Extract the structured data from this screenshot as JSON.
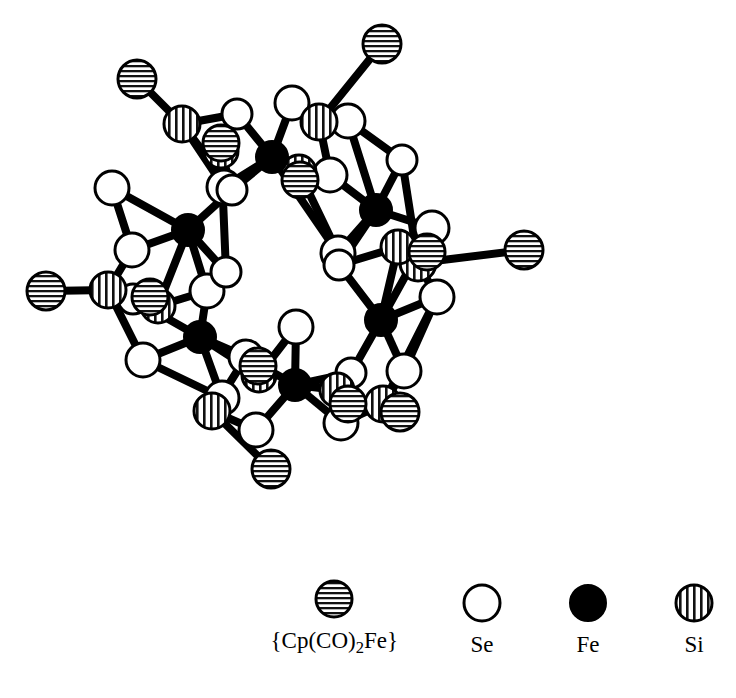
{
  "figure": {
    "background_color": "#ffffff",
    "line_color": "#000000"
  },
  "legend": {
    "items": [
      {
        "symbol": "horizontal-striped-circle",
        "label_html": "{Cp(CO)<sub>2</sub>Fe}",
        "label_text": "{Cp(CO)2Fe}",
        "fill": "horizontal-hatch",
        "name": "cp-co-2-fe"
      },
      {
        "symbol": "open-circle",
        "label_html": "Se",
        "label_text": "Se",
        "fill": "white",
        "name": "se"
      },
      {
        "symbol": "filled-circle",
        "label_html": "Fe",
        "label_text": "Fe",
        "fill": "black",
        "name": "fe"
      },
      {
        "symbol": "vertical-striped-circle",
        "label_html": "Si",
        "label_text": "Si",
        "fill": "vertical-hatch",
        "name": "si"
      }
    ]
  },
  "structure": {
    "symmetry": "6-fold (hexameric ring)",
    "center": {
      "x": 285,
      "y": 272
    },
    "atom_counts": {
      "Fe": 6,
      "Se": 24,
      "Si": 12,
      "CpCO2Fe": 6
    },
    "atoms": [
      {
        "id": "Fe1",
        "element": "Fe",
        "x": 272,
        "y": 157,
        "r": 16
      },
      {
        "id": "Fe2",
        "element": "Fe",
        "x": 376,
        "y": 210,
        "r": 16
      },
      {
        "id": "Fe3",
        "element": "Fe",
        "x": 381,
        "y": 320,
        "r": 16
      },
      {
        "id": "Fe4",
        "element": "Fe",
        "x": 295,
        "y": 385,
        "r": 16
      },
      {
        "id": "Fe5",
        "element": "Fe",
        "x": 200,
        "y": 337,
        "r": 16
      },
      {
        "id": "Fe6",
        "element": "Fe",
        "x": 188,
        "y": 230,
        "r": 16
      },
      {
        "id": "Se1a",
        "element": "Se",
        "x": 292,
        "y": 103,
        "r": 17
      },
      {
        "id": "Se1b",
        "element": "Se",
        "x": 224,
        "y": 187,
        "r": 17
      },
      {
        "id": "Se1c",
        "element": "Se",
        "x": 237,
        "y": 114,
        "r": 15
      },
      {
        "id": "Se1d",
        "element": "Se",
        "x": 330,
        "y": 175,
        "r": 17
      },
      {
        "id": "Se2a",
        "element": "Se",
        "x": 348,
        "y": 121,
        "r": 17
      },
      {
        "id": "Se2b",
        "element": "Se",
        "x": 338,
        "y": 253,
        "r": 17
      },
      {
        "id": "Se2c",
        "element": "Se",
        "x": 402,
        "y": 160,
        "r": 15
      },
      {
        "id": "Se2d",
        "element": "Se",
        "x": 432,
        "y": 228,
        "r": 17
      },
      {
        "id": "Se3a",
        "element": "Se",
        "x": 437,
        "y": 297,
        "r": 17
      },
      {
        "id": "Se3b",
        "element": "Se",
        "x": 351,
        "y": 373,
        "r": 15
      },
      {
        "id": "Se3c",
        "element": "Se",
        "x": 404,
        "y": 371,
        "r": 17
      },
      {
        "id": "Se3d",
        "element": "Se",
        "x": 339,
        "y": 265,
        "r": 15
      },
      {
        "id": "Se4a",
        "element": "Se",
        "x": 256,
        "y": 430,
        "r": 17
      },
      {
        "id": "Se4b",
        "element": "Se",
        "x": 341,
        "y": 423,
        "r": 17
      },
      {
        "id": "Se4c",
        "element": "Se",
        "x": 246,
        "y": 357,
        "r": 17
      },
      {
        "id": "Se4d",
        "element": "Se",
        "x": 296,
        "y": 327,
        "r": 17
      },
      {
        "id": "Se5a",
        "element": "Se",
        "x": 143,
        "y": 360,
        "r": 17
      },
      {
        "id": "Se5b",
        "element": "Se",
        "x": 222,
        "y": 398,
        "r": 17
      },
      {
        "id": "Se5c",
        "element": "Se",
        "x": 133,
        "y": 299,
        "r": 15
      },
      {
        "id": "Se5d",
        "element": "Se",
        "x": 207,
        "y": 291,
        "r": 17
      },
      {
        "id": "Se6a",
        "element": "Se",
        "x": 132,
        "y": 250,
        "r": 17
      },
      {
        "id": "Se6b",
        "element": "Se",
        "x": 226,
        "y": 272,
        "r": 15
      },
      {
        "id": "Se6c",
        "element": "Se",
        "x": 112,
        "y": 188,
        "r": 17
      },
      {
        "id": "Se6d",
        "element": "Se",
        "x": 232,
        "y": 190,
        "r": 15
      },
      {
        "id": "Si1a",
        "element": "Si",
        "x": 182,
        "y": 124,
        "r": 18
      },
      {
        "id": "Si1b",
        "element": "Si",
        "x": 221,
        "y": 151,
        "r": 17
      },
      {
        "id": "Si2a",
        "element": "Si",
        "x": 319,
        "y": 122,
        "r": 18
      },
      {
        "id": "Si2b",
        "element": "Si",
        "x": 299,
        "y": 172,
        "r": 17
      },
      {
        "id": "Si3a",
        "element": "Si",
        "x": 418,
        "y": 263,
        "r": 18
      },
      {
        "id": "Si3b",
        "element": "Si",
        "x": 398,
        "y": 247,
        "r": 17
      },
      {
        "id": "Si4a",
        "element": "Si",
        "x": 383,
        "y": 404,
        "r": 18
      },
      {
        "id": "Si4b",
        "element": "Si",
        "x": 337,
        "y": 390,
        "r": 17
      },
      {
        "id": "Si5a",
        "element": "Si",
        "x": 212,
        "y": 411,
        "r": 18
      },
      {
        "id": "Si5b",
        "element": "Si",
        "x": 259,
        "y": 375,
        "r": 17
      },
      {
        "id": "Si6a",
        "element": "Si",
        "x": 108,
        "y": 290,
        "r": 18
      },
      {
        "id": "Si6b",
        "element": "Si",
        "x": 158,
        "y": 306,
        "r": 17
      },
      {
        "id": "Cp1",
        "element": "CpCO2Fe",
        "x": 137,
        "y": 79,
        "r": 19
      },
      {
        "id": "Cp1b",
        "element": "CpCO2Fe",
        "x": 221,
        "y": 143,
        "r": 18
      },
      {
        "id": "Cp2",
        "element": "CpCO2Fe",
        "x": 382,
        "y": 44,
        "r": 19
      },
      {
        "id": "Cp2b",
        "element": "CpCO2Fe",
        "x": 300,
        "y": 180,
        "r": 18
      },
      {
        "id": "Cp3",
        "element": "CpCO2Fe",
        "x": 524,
        "y": 250,
        "r": 19
      },
      {
        "id": "Cp3b",
        "element": "CpCO2Fe",
        "x": 427,
        "y": 252,
        "r": 18
      },
      {
        "id": "Cp4",
        "element": "CpCO2Fe",
        "x": 400,
        "y": 412,
        "r": 19
      },
      {
        "id": "Cp4b",
        "element": "CpCO2Fe",
        "x": 348,
        "y": 404,
        "r": 18
      },
      {
        "id": "Cp5",
        "element": "CpCO2Fe",
        "x": 271,
        "y": 469,
        "r": 19
      },
      {
        "id": "Cp5b",
        "element": "CpCO2Fe",
        "x": 258,
        "y": 366,
        "r": 18
      },
      {
        "id": "Cp6",
        "element": "CpCO2Fe",
        "x": 46,
        "y": 291,
        "r": 19
      },
      {
        "id": "Cp6b",
        "element": "CpCO2Fe",
        "x": 150,
        "y": 297,
        "r": 18
      }
    ],
    "bonds": [
      [
        "Fe1",
        "Se1a"
      ],
      [
        "Fe1",
        "Se1b"
      ],
      [
        "Fe1",
        "Se1d"
      ],
      [
        "Fe1",
        "Se2b"
      ],
      [
        "Fe1",
        "Se6d"
      ],
      [
        "Fe1",
        "Si2b"
      ],
      [
        "Fe2",
        "Se2a"
      ],
      [
        "Fe2",
        "Se2c"
      ],
      [
        "Fe2",
        "Se2d"
      ],
      [
        "Fe2",
        "Se1d"
      ],
      [
        "Fe2",
        "Se2b"
      ],
      [
        "Fe2",
        "Se3d"
      ],
      [
        "Fe3",
        "Se3a"
      ],
      [
        "Fe3",
        "Se3c"
      ],
      [
        "Fe3",
        "Se2d"
      ],
      [
        "Fe3",
        "Se3b"
      ],
      [
        "Fe3",
        "Se3d"
      ],
      [
        "Fe3",
        "Si3b"
      ],
      [
        "Fe4",
        "Se4a"
      ],
      [
        "Fe4",
        "Se4b"
      ],
      [
        "Fe4",
        "Se4c"
      ],
      [
        "Fe4",
        "Se4d"
      ],
      [
        "Fe4",
        "Se3b"
      ],
      [
        "Fe4",
        "Si4b"
      ],
      [
        "Fe5",
        "Se5a"
      ],
      [
        "Fe5",
        "Se5b"
      ],
      [
        "Fe5",
        "Se5c"
      ],
      [
        "Fe5",
        "Se5d"
      ],
      [
        "Fe5",
        "Se4c"
      ],
      [
        "Fe5",
        "Si5b"
      ],
      [
        "Fe6",
        "Se6a"
      ],
      [
        "Fe6",
        "Se6b"
      ],
      [
        "Fe6",
        "Se6c"
      ],
      [
        "Fe6",
        "Se6d"
      ],
      [
        "Fe6",
        "Se5d"
      ],
      [
        "Fe6",
        "Si6b"
      ],
      [
        "Si1a",
        "Se1c"
      ],
      [
        "Si1a",
        "Se1b"
      ],
      [
        "Si1a",
        "Se6d"
      ],
      [
        "Si1a",
        "Cp1"
      ],
      [
        "Si1b",
        "Se1c"
      ],
      [
        "Si1b",
        "Se6d"
      ],
      [
        "Si1b",
        "Se6b"
      ],
      [
        "Se1c",
        "Fe1"
      ],
      [
        "Se1a",
        "Si2a"
      ],
      [
        "Si2a",
        "Se1a"
      ],
      [
        "Si2a",
        "Se2a"
      ],
      [
        "Si2a",
        "Se1d"
      ],
      [
        "Si2a",
        "Cp2"
      ],
      [
        "Si2b",
        "Se1d"
      ],
      [
        "Si2b",
        "Se2b"
      ],
      [
        "Si3a",
        "Se2d"
      ],
      [
        "Si3a",
        "Se3a"
      ],
      [
        "Si3a",
        "Se2c"
      ],
      [
        "Si3a",
        "Cp3"
      ],
      [
        "Si3b",
        "Se2d"
      ],
      [
        "Si3b",
        "Se3d"
      ],
      [
        "Si4a",
        "Se3c"
      ],
      [
        "Si4a",
        "Se4b"
      ],
      [
        "Si4a",
        "Se3a"
      ],
      [
        "Si4a",
        "Cp4"
      ],
      [
        "Si4b",
        "Se3b"
      ],
      [
        "Si4b",
        "Se4b"
      ],
      [
        "Si5a",
        "Se4a"
      ],
      [
        "Si5a",
        "Se5b"
      ],
      [
        "Si5a",
        "Se4c"
      ],
      [
        "Si5a",
        "Cp5"
      ],
      [
        "Si5b",
        "Se4c"
      ],
      [
        "Si5b",
        "Se4d"
      ],
      [
        "Si6a",
        "Se5c"
      ],
      [
        "Si6a",
        "Se6a"
      ],
      [
        "Si6a",
        "Se5a"
      ],
      [
        "Si6a",
        "Cp6"
      ],
      [
        "Si6b",
        "Se5d"
      ],
      [
        "Si6b",
        "Se5c"
      ],
      [
        "Se2c",
        "Se2a"
      ],
      [
        "Se3c",
        "Se3a"
      ],
      [
        "Se5b",
        "Se5a"
      ],
      [
        "Se6c",
        "Se6a"
      ]
    ]
  }
}
